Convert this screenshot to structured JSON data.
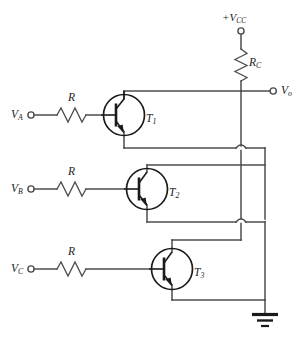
{
  "diagram": {
    "supply": {
      "label_main": "+V",
      "label_sub": "CC",
      "terminal": "supply-terminal"
    },
    "output": {
      "label_main": "V",
      "label_sub": "o",
      "terminal": "output-terminal"
    },
    "collector_resistor": {
      "label_main": "R",
      "label_sub": "C"
    },
    "ground": {
      "name": "ground-symbol"
    },
    "inputs": [
      {
        "id": "input-a",
        "label_main": "V",
        "label_sub": "A",
        "resistor_label": "R",
        "transistor_main": "T",
        "transistor_sub": "1"
      },
      {
        "id": "input-b",
        "label_main": "V",
        "label_sub": "B",
        "resistor_label": "R",
        "transistor_main": "T",
        "transistor_sub": "2"
      },
      {
        "id": "input-c",
        "label_main": "V",
        "label_sub": "C",
        "resistor_label": "R",
        "transistor_main": "T",
        "transistor_sub": "3"
      }
    ],
    "colors": {
      "wire": "#4c4c4c",
      "device": "#1a1a1a",
      "background": "#ffffff",
      "text": "#1c1c1c"
    }
  }
}
